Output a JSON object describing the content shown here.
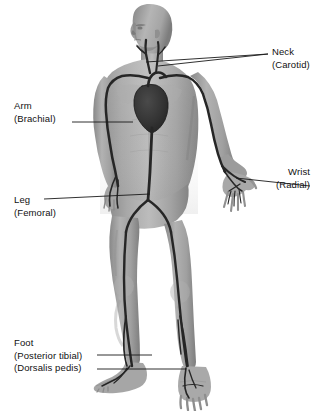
{
  "diagram": {
    "background_color": "#ffffff",
    "skin_tone_light": "#b9b9b9",
    "skin_tone_mid": "#9a9a9a",
    "skin_tone_dark": "#6f6f6f",
    "artery_color": "#2a2a2a",
    "heart_color": "#3b3b3b",
    "leader_color": "#1a1a1a",
    "text_color": "#111111"
  },
  "labels": {
    "neck": {
      "name": "Neck",
      "artery": "(Carotid)"
    },
    "arm": {
      "name": "Arm",
      "artery": "(Brachial)"
    },
    "wrist": {
      "name": "Wrist",
      "artery": "(Radial)"
    },
    "leg": {
      "name": "Leg",
      "artery": "(Femoral)"
    },
    "foot": {
      "name": "Foot",
      "artery_posterior": "(Posterior tibial)",
      "artery_dorsalis": "(Dorsalis pedis)"
    }
  }
}
